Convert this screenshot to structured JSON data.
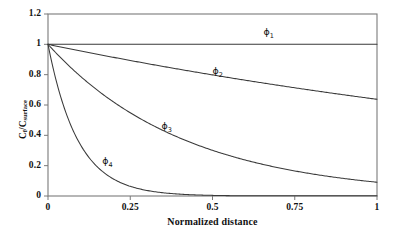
{
  "chart_data": {
    "type": "line",
    "title": "",
    "xlabel": "Normalized distance",
    "ylabel": "C_f/C_surface",
    "ylabel_parts": {
      "main1": "C",
      "sub1": "f",
      "slash": "/C",
      "sub2": "surface"
    },
    "xlim": [
      0,
      1
    ],
    "ylim": [
      0,
      1.2
    ],
    "xticks": [
      "0",
      "0.25",
      "0.5",
      "0.75",
      "1"
    ],
    "xtick_values": [
      0,
      0.25,
      0.5,
      0.75,
      1
    ],
    "yticks": [
      "0",
      "0.2",
      "0.4",
      "0.6",
      "0.8",
      "1",
      "1.2"
    ],
    "ytick_values": [
      0,
      0.2,
      0.4,
      0.6,
      0.8,
      1,
      1.2
    ],
    "grid": false,
    "legend_position": "inline-annotations",
    "line_color": "#3a3a3a",
    "axis_color": "#7a7a7a",
    "series": [
      {
        "name": "ϕ1",
        "label": "ϕ",
        "label_sub": "1",
        "decay": 0.0,
        "x": [
          0,
          0.125,
          0.25,
          0.375,
          0.5,
          0.625,
          0.75,
          0.875,
          1
        ],
        "values": [
          1.0,
          1.0,
          1.0,
          1.0,
          1.0,
          1.0,
          1.0,
          1.0,
          1.0
        ],
        "annotation_at": {
          "x": 0.655,
          "y": 1.075
        }
      },
      {
        "name": "ϕ2",
        "label": "ϕ",
        "label_sub": "2",
        "decay": 0.45,
        "x": [
          0,
          0.125,
          0.25,
          0.375,
          0.5,
          0.625,
          0.75,
          0.875,
          1
        ],
        "values": [
          1.0,
          0.945,
          0.894,
          0.845,
          0.799,
          0.755,
          0.714,
          0.675,
          0.638
        ],
        "annotation_at": {
          "x": 0.5,
          "y": 0.815
        }
      },
      {
        "name": "ϕ3",
        "label": "ϕ",
        "label_sub": "3",
        "decay": 2.4,
        "x": [
          0,
          0.125,
          0.25,
          0.375,
          0.5,
          0.625,
          0.75,
          0.875,
          1
        ],
        "values": [
          1.0,
          0.741,
          0.549,
          0.407,
          0.301,
          0.223,
          0.165,
          0.123,
          0.091
        ],
        "annotation_at": {
          "x": 0.345,
          "y": 0.455
        }
      },
      {
        "name": "ϕ4",
        "label": "ϕ",
        "label_sub": "4",
        "decay": 11.0,
        "x": [
          0,
          0.05,
          0.1,
          0.15,
          0.2,
          0.25,
          0.3,
          0.4,
          0.5,
          0.75,
          1
        ],
        "values": [
          1.0,
          0.577,
          0.333,
          0.192,
          0.111,
          0.064,
          0.037,
          0.012,
          0.004,
          0.0,
          0.0
        ],
        "annotation_at": {
          "x": 0.165,
          "y": 0.225
        }
      }
    ]
  }
}
